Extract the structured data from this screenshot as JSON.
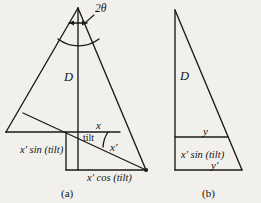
{
  "figure": {
    "background_color": "#f2f0ec",
    "line_color": "#1a1a1a",
    "panels": [
      {
        "caption": "(a)",
        "labels": {
          "apex_angle": "2θ",
          "vertical_side": "D",
          "horizontal_segment": "x",
          "tilt_angle": "tilt",
          "tilted_segment": "x′",
          "left_projection": "x′ sin (tilt)",
          "bottom_projection": "x′ cos (tilt)"
        }
      },
      {
        "caption": "(b)",
        "labels": {
          "vertical_side": "D",
          "upper_segment": "y",
          "left_projection": "x′ sin (tilt)",
          "lower_segment": "y′"
        }
      }
    ]
  },
  "panel_a": {
    "apex_angle": "2θ",
    "D": "D",
    "x": "x",
    "tilt": "tilt",
    "x_prime": "x′",
    "x_sin_tilt": "x′ sin (tilt)",
    "x_cos_tilt": "x′ cos (tilt)",
    "caption": "(a)"
  },
  "panel_b": {
    "D": "D",
    "y": "y",
    "x_sin_tilt": "x′ sin (tilt)",
    "y_prime": "y′",
    "caption": "(b)"
  }
}
